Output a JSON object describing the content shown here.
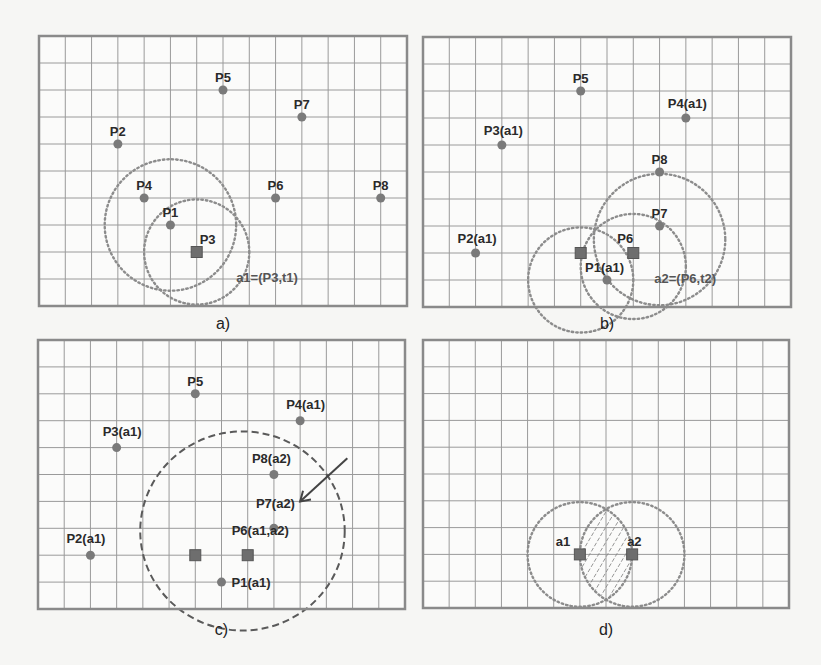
{
  "figure": {
    "grid": {
      "cols": 14,
      "rows": 10
    },
    "panels": [
      {
        "id": "a",
        "caption": "a)",
        "points": [
          {
            "label": "P5",
            "x": 7,
            "y": 2,
            "shape": "dot"
          },
          {
            "label": "P7",
            "x": 10,
            "y": 3,
            "shape": "dot"
          },
          {
            "label": "P2",
            "x": 3,
            "y": 4,
            "shape": "dot"
          },
          {
            "label": "P4",
            "x": 4,
            "y": 6,
            "shape": "dot"
          },
          {
            "label": "P6",
            "x": 9,
            "y": 6,
            "shape": "dot"
          },
          {
            "label": "P8",
            "x": 13,
            "y": 6,
            "shape": "dot"
          },
          {
            "label": "P1",
            "x": 5,
            "y": 7,
            "shape": "dot"
          },
          {
            "label": "P3",
            "x": 6,
            "y": 8,
            "shape": "square"
          }
        ],
        "circles": [
          {
            "cx": 5,
            "cy": 7,
            "r": 2.5,
            "style": "dotted"
          },
          {
            "cx": 6,
            "cy": 8,
            "r": 2,
            "style": "dotted"
          }
        ],
        "annotations": [
          {
            "text": "a1=(P3,t1)",
            "x": 7.5,
            "y": 9.1
          }
        ]
      },
      {
        "id": "b",
        "caption": "b)",
        "points": [
          {
            "label": "P5",
            "x": 6,
            "y": 2,
            "shape": "dot"
          },
          {
            "label": "P4(a1)",
            "x": 10,
            "y": 3,
            "shape": "dot"
          },
          {
            "label": "P3(a1)",
            "x": 3,
            "y": 4,
            "shape": "dot"
          },
          {
            "label": "P8",
            "x": 9,
            "y": 5,
            "shape": "dot"
          },
          {
            "label": "P7",
            "x": 9,
            "y": 7,
            "shape": "dot"
          },
          {
            "label": "P2(a1)",
            "x": 2,
            "y": 8,
            "shape": "dot"
          },
          {
            "label": "",
            "x": 6,
            "y": 8,
            "shape": "square"
          },
          {
            "label": "P6",
            "x": 8,
            "y": 8,
            "shape": "square"
          },
          {
            "label": "P1(a1)",
            "x": 7,
            "y": 9,
            "shape": "dot"
          }
        ],
        "circles": [
          {
            "cx": 6,
            "cy": 9,
            "r": 2,
            "style": "dotted"
          },
          {
            "cx": 8,
            "cy": 8.5,
            "r": 2,
            "style": "dotted"
          },
          {
            "cx": 9,
            "cy": 7.5,
            "r": 2.5,
            "style": "dotted"
          }
        ],
        "annotations": [
          {
            "text": "a2=(P6,t2)",
            "x": 8.8,
            "y": 9.1
          }
        ]
      },
      {
        "id": "c",
        "caption": "c)",
        "points": [
          {
            "label": "P5",
            "x": 6,
            "y": 2,
            "shape": "dot"
          },
          {
            "label": "P4(a1)",
            "x": 10,
            "y": 3,
            "shape": "dot"
          },
          {
            "label": "P3(a1)",
            "x": 3,
            "y": 4,
            "shape": "dot"
          },
          {
            "label": "P8(a2)",
            "x": 9,
            "y": 5,
            "shape": "dot"
          },
          {
            "label": "P7(a2)",
            "x": 9,
            "y": 7,
            "shape": "dot"
          },
          {
            "label": "P2(a1)",
            "x": 2,
            "y": 8,
            "shape": "dot"
          },
          {
            "label": "",
            "x": 6,
            "y": 8,
            "shape": "square"
          },
          {
            "label": "P6(a1,a2)",
            "x": 8,
            "y": 8,
            "shape": "square"
          },
          {
            "label": "P1(a1)",
            "x": 7,
            "y": 9,
            "shape": "dot"
          }
        ],
        "ellipse": {
          "cx": 7.8,
          "cy": 7.1,
          "rx": 3.9,
          "ry": 3.7,
          "style": "dashed"
        },
        "arrow": {
          "from": [
            11.8,
            4.4
          ],
          "to": [
            10,
            6
          ]
        }
      },
      {
        "id": "d",
        "caption": "d)",
        "points": [
          {
            "label": "a1",
            "x": 6,
            "y": 8,
            "shape": "square"
          },
          {
            "label": "a2",
            "x": 8,
            "y": 8,
            "shape": "square"
          }
        ],
        "circles": [
          {
            "cx": 6,
            "cy": 8,
            "r": 2,
            "style": "dotted"
          },
          {
            "cx": 8,
            "cy": 8,
            "r": 2,
            "style": "dotted"
          }
        ],
        "intersection_hatched": true
      }
    ]
  }
}
